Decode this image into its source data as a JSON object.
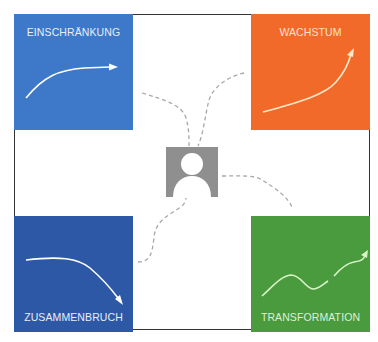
{
  "diagram": {
    "center": {
      "icon": "person-icon"
    },
    "quadrants": [
      {
        "id": "top-left",
        "label": "EINSCHRÄNKUNG",
        "color": "#3d78c9",
        "trend_icon": "plateau-arrow-icon"
      },
      {
        "id": "top-right",
        "label": "WACHSTUM",
        "color": "#f26a2a",
        "trend_icon": "exponential-growth-arrow-icon"
      },
      {
        "id": "bottom-left",
        "label": "ZUSAMMENBRUCH",
        "color": "#2d58a6",
        "trend_icon": "decline-arrow-icon"
      },
      {
        "id": "bottom-right",
        "label": "TRANSFORMATION",
        "color": "#4a9a3e",
        "trend_icon": "wave-growth-arrow-icon"
      }
    ],
    "connector_style": "dashed-gray"
  }
}
